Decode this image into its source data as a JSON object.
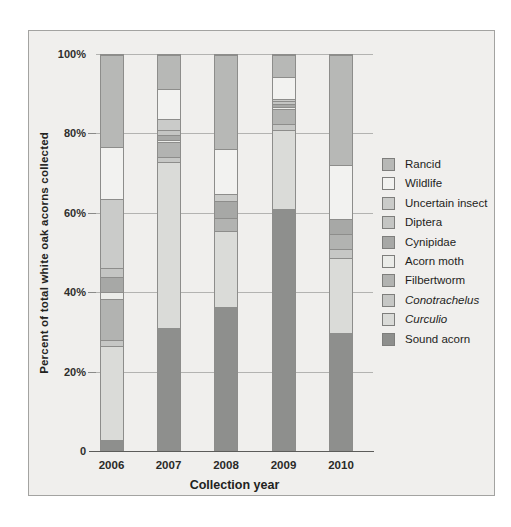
{
  "figure": {
    "background_color": "#f0efed",
    "frame_border_color": "#a3a3a1"
  },
  "chart_data": {
    "type": "bar",
    "stacked": true,
    "xlabel": "Collection year",
    "ylabel": "Percent of total white oak acorns collected",
    "categories": [
      "2006",
      "2007",
      "2008",
      "2009",
      "2010"
    ],
    "ylim": [
      0,
      100
    ],
    "yticks": [
      {
        "value": 100,
        "label": "100%"
      },
      {
        "value": 80,
        "label": "80%"
      },
      {
        "value": 60,
        "label": "60%"
      },
      {
        "value": 40,
        "label": "40%"
      },
      {
        "value": 20,
        "label": "20%"
      },
      {
        "value": 0,
        "label": "0"
      }
    ],
    "grid": true,
    "legend_position": "right",
    "legend_order_top_to_bottom": [
      "Rancid",
      "Wildlife",
      "Uncertain insect",
      "Diptera",
      "Cynipidae",
      "Acorn moth",
      "Filbertworm",
      "Conotrachelus",
      "Curculio",
      "Sound acorn"
    ],
    "series": [
      {
        "name": "Sound acorn",
        "color": "#8e8f8d",
        "italic": false,
        "values": [
          2.5,
          31.0,
          36.3,
          61.0,
          29.5
        ]
      },
      {
        "name": "Curculio",
        "color": "#dadbd8",
        "italic": true,
        "values": [
          23.8,
          42.0,
          19.1,
          20.0,
          19.2
        ]
      },
      {
        "name": "Conotrachelus",
        "color": "#c6c7c5",
        "italic": true,
        "values": [
          1.5,
          1.3,
          0,
          1.5,
          2.1
        ]
      },
      {
        "name": "Filbertworm",
        "color": "#b2b3b1",
        "italic": false,
        "values": [
          10.5,
          3.7,
          3.3,
          3.8,
          3.8
        ]
      },
      {
        "name": "Acorn moth",
        "color": "#ebece9",
        "italic": false,
        "values": [
          1.8,
          0.6,
          0,
          0.5,
          0
        ]
      },
      {
        "name": "Cynipidae",
        "color": "#a7a8a6",
        "italic": false,
        "values": [
          3.8,
          1.2,
          4.3,
          0.7,
          3.8
        ]
      },
      {
        "name": "Diptera",
        "color": "#c4c5c3",
        "italic": false,
        "values": [
          2.2,
          1.2,
          0,
          0.8,
          0
        ]
      },
      {
        "name": "Uncertain insect",
        "color": "#cacbc9",
        "italic": false,
        "values": [
          17.4,
          2.7,
          1.8,
          0.7,
          0
        ]
      },
      {
        "name": "Wildlife",
        "color": "#f2f2f0",
        "italic": false,
        "values": [
          13.2,
          7.6,
          11.3,
          5.4,
          13.8
        ]
      },
      {
        "name": "Rancid",
        "color": "#b7b8b6",
        "italic": false,
        "values": [
          23.3,
          8.7,
          23.9,
          5.6,
          27.8
        ]
      }
    ]
  }
}
